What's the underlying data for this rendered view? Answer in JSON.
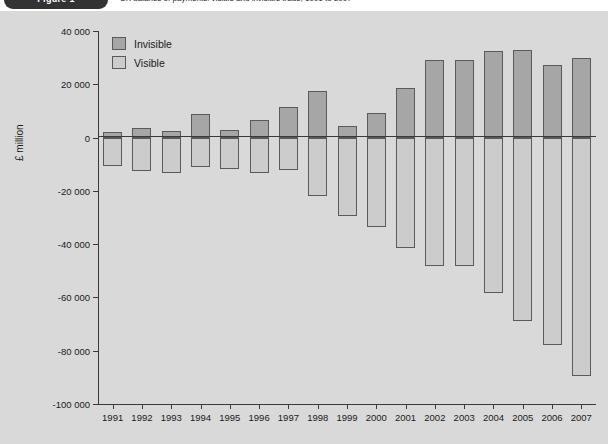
{
  "header": {
    "figure_badge": "Figure 1",
    "caption": "UK balance of payments: visible and invisible trade, 1991 to 2007"
  },
  "chart_data": {
    "type": "bar",
    "title": "",
    "subtitle": "",
    "xlabel": "",
    "ylabel": "£ million",
    "ylim": [
      -100000,
      40000
    ],
    "ytick_step": 20000,
    "yticks": [
      40000,
      20000,
      0,
      -20000,
      -40000,
      -60000,
      -80000,
      -100000
    ],
    "ytick_labels": [
      "40 000",
      "20 000",
      "0",
      "-20 000",
      "-40 000",
      "-60 000",
      "-80 000",
      "-100 000"
    ],
    "grid": false,
    "legend_position": "top-left",
    "categories": [
      "1991",
      "1992",
      "1993",
      "1994",
      "1995",
      "1996",
      "1997",
      "1998",
      "1999",
      "2000",
      "2001",
      "2002",
      "2003",
      "2004",
      "2005",
      "2006",
      "2007"
    ],
    "series": [
      {
        "name": "Invisible",
        "color": "#a6a6a6",
        "values": [
          2200,
          3700,
          2400,
          8700,
          3000,
          6600,
          11600,
          17600,
          4400,
          9400,
          18700,
          29000,
          29000,
          32600,
          33000,
          27200,
          30000
        ]
      },
      {
        "name": "Visible",
        "color": "#cccccc",
        "values": [
          -10500,
          -12700,
          -13200,
          -11000,
          -11700,
          -13300,
          -12000,
          -22000,
          -29500,
          -33700,
          -41400,
          -48300,
          -48200,
          -58200,
          -68700,
          -77900,
          -89600
        ]
      }
    ]
  }
}
